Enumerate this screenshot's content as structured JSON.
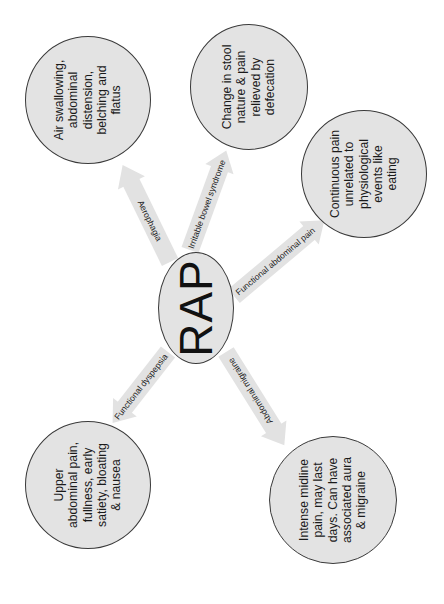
{
  "diagram": {
    "orientation": "rotated 90 degrees counter-clockwise",
    "colors": {
      "background": "#ffffff",
      "node_fill": "#e3e3e3",
      "node_border": "#3a3a3a",
      "arrow_fill": "#e2e2e2",
      "text": "#1a1a1a"
    },
    "center": {
      "label": "RAP"
    },
    "branches": [
      {
        "arrow_label": "Aerophagia",
        "description": "Air swallowing,\nabdominal\ndistension,\nbelching and\nflatus"
      },
      {
        "arrow_label": "Irritable bowel syndrome",
        "description": "Change in stool\nnature & pain\nrelieved by\ndefecation"
      },
      {
        "arrow_label": "Functional abdominal pain",
        "description": "Continuous pain\nunrelated to\nphysiological\nevents like\neating"
      },
      {
        "arrow_label": "Functional dyspepsia",
        "description": "Upper\nabdominal pain,\nfullness, early\nsatiety, bloating\n& nausea"
      },
      {
        "arrow_label": "Abdominal migraine",
        "description": "Intense midline\npain, may last\ndays. Can have\nassociated aura\n& migraine"
      }
    ]
  }
}
